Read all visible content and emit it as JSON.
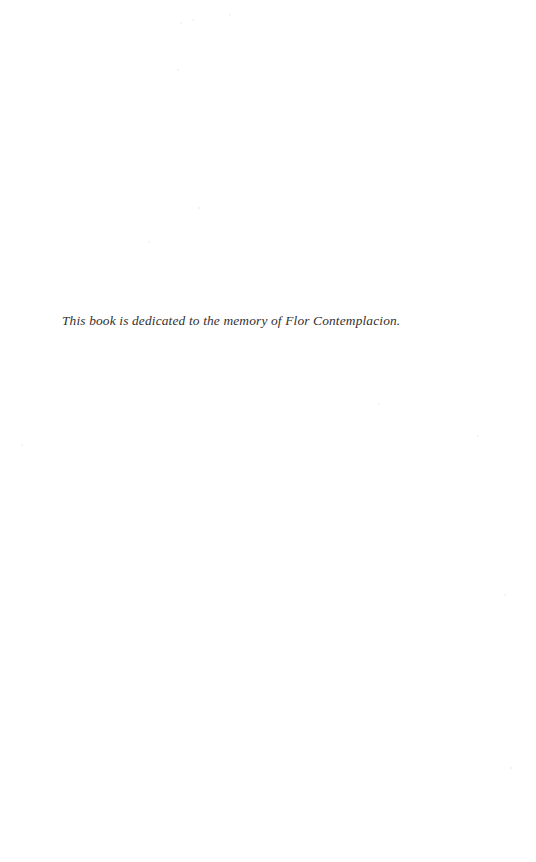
{
  "page": {
    "type": "book-dedication-page",
    "background_color": "#ffffff",
    "width": 536,
    "height": 862
  },
  "dedication": {
    "text": "This book is dedicated to the memory of Flor Contemplacion.",
    "style": "italic-serif",
    "color": "#33302f",
    "position": {
      "left": 62,
      "top": 311
    }
  },
  "artifacts": {
    "label": "scan-speckles",
    "color": "#f2f2f4",
    "specks": [
      {
        "x": 180,
        "y": 22,
        "size": 2
      },
      {
        "x": 192,
        "y": 19,
        "size": 2
      },
      {
        "x": 172,
        "y": 26,
        "size": 1
      },
      {
        "x": 229,
        "y": 14,
        "size": 2
      },
      {
        "x": 177,
        "y": 69,
        "size": 2
      },
      {
        "x": 198,
        "y": 207,
        "size": 2
      },
      {
        "x": 148,
        "y": 241,
        "size": 2
      },
      {
        "x": 404,
        "y": 100,
        "size": 1
      },
      {
        "x": 300,
        "y": 118,
        "size": 1
      },
      {
        "x": 378,
        "y": 403,
        "size": 2
      },
      {
        "x": 21,
        "y": 444,
        "size": 2
      },
      {
        "x": 477,
        "y": 435,
        "size": 2
      },
      {
        "x": 504,
        "y": 594,
        "size": 2
      },
      {
        "x": 510,
        "y": 767,
        "size": 2
      },
      {
        "x": 85,
        "y": 668,
        "size": 1
      },
      {
        "x": 157,
        "y": 550,
        "size": 1
      },
      {
        "x": 443,
        "y": 236,
        "size": 1
      },
      {
        "x": 64,
        "y": 520,
        "size": 1
      }
    ]
  }
}
